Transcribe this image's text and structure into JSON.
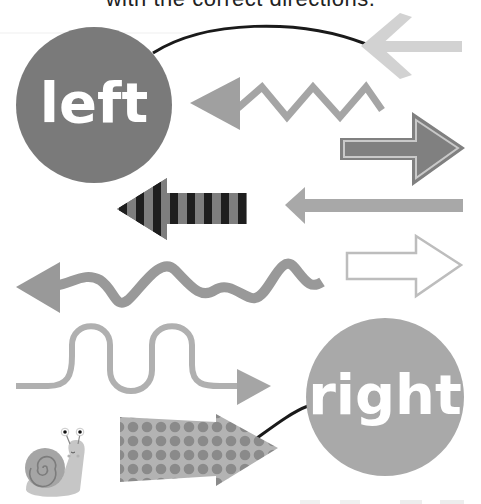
{
  "title": "with the correct directions.",
  "labels": {
    "left": "left",
    "right": "right"
  },
  "colors": {
    "background": "#ffffff",
    "left_circle": "#7a7a7a",
    "right_circle": "#a9a9a9",
    "light_arrow": "#d2d2d2",
    "mid_arrow": "#9a9a9a",
    "dark_arrow": "#808080",
    "stripe_dark": "#1e1e1e",
    "stripe_light": "#7e7e7e",
    "connector_line": "#1a1a1a",
    "snail_shell": "#a5a5a5",
    "snail_body": "#c6c6c6"
  },
  "arrows": [
    {
      "id": "light-chevron-arrow",
      "direction": "left"
    },
    {
      "id": "zigzag-arrow",
      "direction": "left"
    },
    {
      "id": "outlined-block-arrow",
      "direction": "right"
    },
    {
      "id": "striped-arrow",
      "direction": "left"
    },
    {
      "id": "long-thin-arrow",
      "direction": "left"
    },
    {
      "id": "hollow-outline-arrow",
      "direction": "right"
    },
    {
      "id": "wavy-arrow",
      "direction": "left"
    },
    {
      "id": "loop-wave-arrow",
      "direction": "right"
    },
    {
      "id": "polka-dot-arrow",
      "direction": "right"
    }
  ],
  "decorations": {
    "snail": "snail-illustration"
  }
}
